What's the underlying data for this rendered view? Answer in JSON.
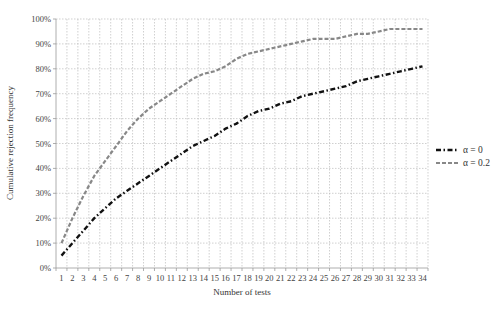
{
  "chart_data": {
    "type": "line",
    "title": "",
    "xlabel": "Number of tests",
    "ylabel": "Cumulative rejection frequency",
    "x": [
      1,
      2,
      3,
      4,
      5,
      6,
      7,
      8,
      9,
      10,
      11,
      12,
      13,
      14,
      15,
      16,
      17,
      18,
      19,
      20,
      21,
      22,
      23,
      24,
      25,
      26,
      27,
      28,
      29,
      30,
      31,
      32,
      33,
      34
    ],
    "xticks": [
      "1",
      "2",
      "3",
      "4",
      "5",
      "6",
      "7",
      "8",
      "9",
      "10",
      "11",
      "12",
      "13",
      "14",
      "15",
      "16",
      "17",
      "18",
      "19",
      "20",
      "21",
      "22",
      "23",
      "24",
      "25",
      "26",
      "27",
      "28",
      "29",
      "30",
      "31",
      "32",
      "33",
      "34"
    ],
    "yticks": [
      "0%",
      "10%",
      "20%",
      "30%",
      "40%",
      "50%",
      "60%",
      "70%",
      "80%",
      "90%",
      "100%"
    ],
    "ylim": [
      0,
      100
    ],
    "grid": true,
    "legend_position": "right",
    "series": [
      {
        "name": "α = 0",
        "color": "#111111",
        "style": "dash-dot",
        "values": [
          5,
          10,
          15,
          20,
          24,
          28,
          31,
          34,
          37,
          40,
          43,
          46,
          49,
          51,
          53,
          56,
          58,
          61,
          63,
          64,
          66,
          67,
          69,
          70,
          71,
          72,
          73,
          75,
          76,
          77,
          78,
          79,
          80,
          81
        ]
      },
      {
        "name": "α = 0.2",
        "color": "#888888",
        "style": "dashed",
        "values": [
          10,
          20,
          29,
          37,
          43,
          49,
          55,
          60,
          64,
          67,
          70,
          73,
          76,
          78,
          79,
          81,
          84,
          86,
          87,
          88,
          89,
          90,
          91,
          92,
          92,
          92,
          93,
          94,
          94,
          95,
          96,
          96,
          96,
          96
        ]
      }
    ]
  }
}
